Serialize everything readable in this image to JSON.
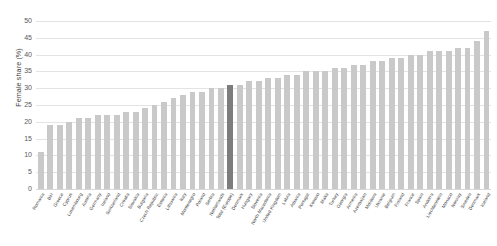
{
  "chart_data": {
    "type": "bar",
    "title": "",
    "xlabel": "",
    "ylabel": "Female share (%)",
    "ylim": [
      0,
      50
    ],
    "yticks": [
      0,
      5,
      10,
      15,
      20,
      25,
      30,
      35,
      40,
      45,
      50
    ],
    "grid": true,
    "legend": null,
    "highlight_category": "Total (Europe)",
    "colors": {
      "bar": "#c9c9c9",
      "highlight_bar": "#7d7d7d",
      "gridline": "#e3e3e3",
      "text": "#3a3a3a"
    },
    "categories": [
      "Romania",
      "BiH",
      "Greece",
      "Cyprus",
      "Luxembourg",
      "Austria",
      "Germany",
      "Ireland",
      "Switzerland",
      "Croatia",
      "Slovakia",
      "Bulgaria",
      "Czech Republic",
      "Estonia",
      "Lithuania",
      "Italy",
      "Montenegro",
      "Poland",
      "Serbia",
      "Netherlands",
      "Total (Europe)",
      "Denmark",
      "Hungary",
      "Slovenia",
      "North Macedonia",
      "United Kingdom",
      "Latvia",
      "Albania",
      "Portugal",
      "Kosovo",
      "Malta",
      "Turkey",
      "Georgia",
      "Armenia",
      "Azerbaijan",
      "Moldova",
      "Ukraine",
      "Belgium",
      "Finland",
      "France",
      "Spain",
      "Andorra",
      "Liechtenstein",
      "Monaco",
      "Norway",
      "Sweden",
      "Denmark ",
      "Iceland"
    ],
    "values": [
      11,
      19,
      19,
      20,
      21,
      21,
      22,
      22,
      22,
      23,
      23,
      24,
      25,
      26,
      27,
      28,
      29,
      29,
      30,
      30,
      31,
      31,
      32,
      32,
      33,
      33,
      34,
      34,
      35,
      35,
      35,
      36,
      36,
      37,
      37,
      38,
      38,
      39,
      39,
      40,
      40,
      41,
      41,
      41,
      42,
      42,
      44,
      47
    ]
  }
}
